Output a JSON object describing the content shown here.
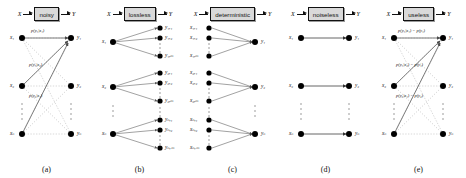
{
  "figure": {
    "input_label": "X",
    "output_label": "Y",
    "panels": [
      {
        "id": "a",
        "caption": "(a)",
        "box_label": "noisy",
        "type": "bipartite-full",
        "left_nodes": [
          "x₁",
          "x₂",
          "xₙ"
        ],
        "right_nodes": [
          "y₁",
          "y₂",
          "yₙ"
        ],
        "edge_labels": [
          "p(y₁|x₁)",
          "p(y₁|x₂)",
          "p(y₂|x₁)"
        ]
      },
      {
        "id": "b",
        "caption": "(b)",
        "box_label": "lossless",
        "type": "fan-out",
        "left_nodes": [
          "x₁",
          "x₂",
          "xₙ"
        ],
        "right_groups": [
          [
            "y₁,₁",
            "y₁,₂",
            "y₁,ₘ"
          ],
          [
            "y₂,₁",
            "y₂,₂",
            "y₂,ₘ"
          ],
          [
            "yₙ,₁",
            "yₙ,₂",
            "yₙ,ₘ"
          ]
        ]
      },
      {
        "id": "c",
        "caption": "(c)",
        "box_label": "deterministic",
        "type": "fan-in",
        "left_groups": [
          [
            "x₁,₁",
            "x₁,₂",
            "x₁,ₘ"
          ],
          [
            "x₂,₁",
            "x₂,₂",
            "x₂,ₘ"
          ],
          [
            "xₙ,₁",
            "xₙ,₂",
            "xₙ,ₘ"
          ]
        ],
        "right_nodes": [
          "y₁",
          "y₂",
          "yₙ"
        ]
      },
      {
        "id": "d",
        "caption": "(d)",
        "box_label": "noiseless",
        "type": "one-to-one",
        "left_nodes": [
          "x₁",
          "x₂",
          "xₙ"
        ],
        "right_nodes": [
          "y₁",
          "y₂",
          "yₙ"
        ]
      },
      {
        "id": "e",
        "caption": "(e)",
        "box_label": "useless",
        "type": "bipartite-full",
        "left_nodes": [
          "x₁",
          "x₂",
          "xₙ"
        ],
        "right_nodes": [
          "y₁",
          "y₂",
          "yₙ"
        ],
        "edge_labels": [
          "p(y₁|x₁) = p(y₁)",
          "p(y₁|x₂) = p(y₁)",
          "p(y₂|x₁) = p(y₂)"
        ]
      }
    ],
    "colors": {
      "box_fill": "#d9d9d9",
      "stroke": "#111111",
      "node_fill": "#000000",
      "dashed_edge": "#b8b8b8",
      "solid_edge": "#6e6e6e"
    }
  }
}
